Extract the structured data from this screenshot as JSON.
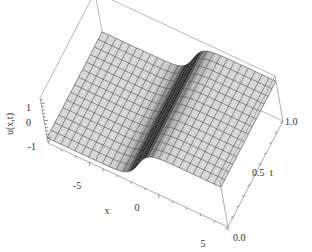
{
  "chart_data": {
    "type": "surface3d",
    "title": "",
    "function_description": "kink / tanh-type traveling wave u(x,t), rising from -1 to +1 across x",
    "xlabel": "x",
    "ylabel": "t",
    "zlabel": "u(x,t)",
    "x_range": [
      -8,
      5
    ],
    "t_range": [
      0.0,
      1.0
    ],
    "z_range": [
      -1.3,
      1.3
    ],
    "x_ticks": [
      "-5",
      "0",
      "5"
    ],
    "t_ticks": [
      "0.0",
      "0.5",
      "1.0"
    ],
    "z_ticks": [
      "1",
      "0",
      "-1"
    ],
    "mesh": {
      "x_lines": 26,
      "t_lines": 14
    },
    "surface": {
      "low_value": -1,
      "high_value": 1,
      "transition_center_x": -1.2,
      "transition_width": 0.9
    },
    "box": true,
    "grid": false,
    "legend": null
  },
  "labels": {
    "z_axis": "u(x,t)",
    "x_axis": "x",
    "t_axis": "t",
    "z_tick_1": "1",
    "z_tick_0": "0",
    "z_tick_m1": "-1",
    "x_tick_m5": "-5",
    "x_tick_0": "0",
    "x_tick_5": "5",
    "t_tick_0": "0.0",
    "t_tick_05": "0.5",
    "t_tick_1": "1.0"
  }
}
